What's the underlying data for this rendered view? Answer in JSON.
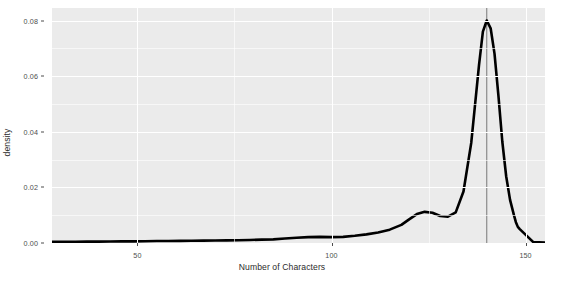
{
  "chart_data": {
    "type": "line",
    "title": "",
    "subtitle": "",
    "xlabel": "Number of Characters",
    "ylabel": "density",
    "xlim": [
      28,
      155
    ],
    "ylim": [
      0,
      0.0845
    ],
    "x_ticks": [
      50,
      100,
      150
    ],
    "x_tick_labels": [
      "50",
      "100",
      "150"
    ],
    "y_ticks": [
      0.0,
      0.02,
      0.04,
      0.06,
      0.08
    ],
    "y_tick_labels": [
      "0.00",
      "0.02",
      "0.04",
      "0.06",
      "0.08"
    ],
    "grid": true,
    "legend": "none",
    "series": [
      {
        "name": "density",
        "color": "#000000",
        "line_width": 2.6,
        "x": [
          28,
          31,
          34,
          37,
          40,
          43,
          46,
          49,
          52,
          55,
          58,
          61,
          64,
          67,
          70,
          73,
          76,
          79,
          82,
          85,
          88,
          91,
          94,
          97,
          100,
          103,
          106,
          109,
          112,
          115,
          118,
          120,
          122,
          124,
          126,
          128,
          130,
          132,
          134,
          136,
          138,
          139,
          140,
          141,
          142,
          143,
          144,
          145,
          146,
          147,
          147.5,
          148,
          148.5,
          152,
          155
        ],
        "y": [
          0.0004,
          0.0004,
          0.00045,
          0.0005,
          0.0005,
          0.00055,
          0.0006,
          0.0006,
          0.00065,
          0.0007,
          0.0007,
          0.00075,
          0.0008,
          0.00085,
          0.0009,
          0.00095,
          0.001,
          0.0011,
          0.0012,
          0.0013,
          0.0016,
          0.0019,
          0.0021,
          0.0022,
          0.0021,
          0.0022,
          0.0026,
          0.0031,
          0.0038,
          0.0048,
          0.0065,
          0.0085,
          0.0104,
          0.0112,
          0.0109,
          0.0097,
          0.0095,
          0.011,
          0.0185,
          0.036,
          0.064,
          0.076,
          0.08,
          0.0772,
          0.068,
          0.053,
          0.0365,
          0.024,
          0.0155,
          0.01,
          0.0075,
          0.0058,
          0.005,
          0.0003,
          0.0002
        ]
      }
    ],
    "reference_lines": [
      {
        "name": "vertical-reference-line",
        "orientation": "vertical",
        "x": 140,
        "color": "#5a5a5a",
        "line_width": 0.8
      }
    ],
    "annotations": [],
    "peak": {
      "x": 140,
      "y": 0.08
    },
    "secondary_bump": {
      "x": 124,
      "y": 0.0112
    }
  },
  "panel": {
    "background_color": "#ebebeb",
    "gridline_color": "#ffffff",
    "axis_text_color": "#4d4d4d",
    "axis_title_color": "#2b2b2b"
  }
}
